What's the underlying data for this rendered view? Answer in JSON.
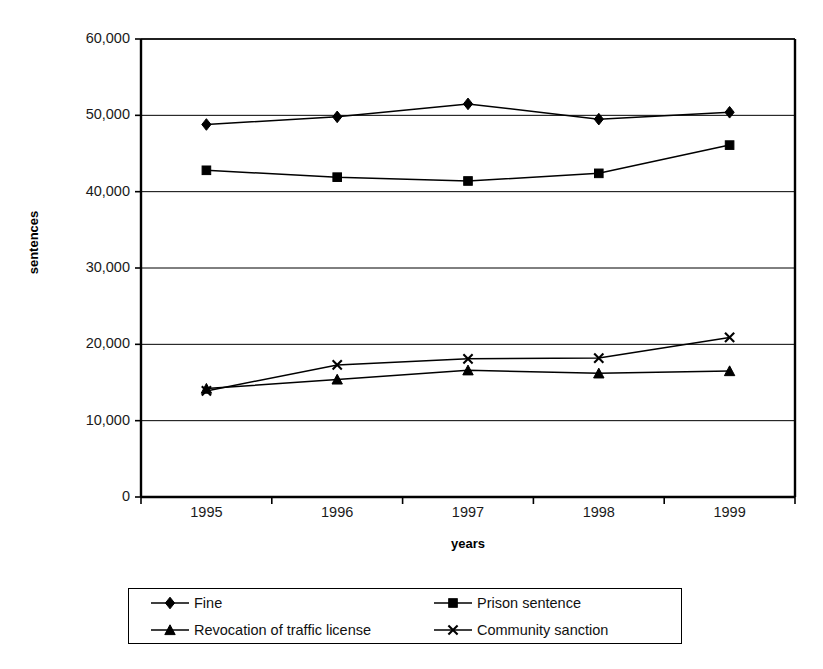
{
  "chart_data": {
    "type": "line",
    "title": "",
    "xlabel": "years",
    "ylabel": "sentences",
    "categories": [
      "1995",
      "1996",
      "1997",
      "1998",
      "1999"
    ],
    "ylim": [
      0,
      60000
    ],
    "ytick_labels": [
      "0",
      "10,000",
      "20,000",
      "30,000",
      "40,000",
      "50,000",
      "60,000"
    ],
    "ytick_values": [
      0,
      10000,
      20000,
      30000,
      40000,
      50000,
      60000
    ],
    "grid": "horizontal",
    "legend_position": "bottom",
    "series": [
      {
        "name": "Fine",
        "marker": "diamond",
        "color": "#000000",
        "values": [
          48800,
          49800,
          51500,
          49500,
          50400
        ]
      },
      {
        "name": "Prison sentence",
        "marker": "square",
        "color": "#000000",
        "values": [
          42800,
          41900,
          41400,
          42400,
          46100
        ]
      },
      {
        "name": "Revocation of traffic license",
        "marker": "triangle",
        "color": "#000000",
        "values": [
          14200,
          15400,
          16600,
          16200,
          16500
        ]
      },
      {
        "name": "Community sanction",
        "marker": "cross",
        "color": "#000000",
        "values": [
          13900,
          17300,
          18100,
          18200,
          20900
        ]
      }
    ]
  },
  "legend": {
    "entries": [
      {
        "label": "Fine",
        "marker": "diamond"
      },
      {
        "label": "Prison sentence",
        "marker": "square"
      },
      {
        "label": "Revocation of traffic license",
        "marker": "triangle"
      },
      {
        "label": "Community sanction",
        "marker": "cross"
      }
    ]
  }
}
